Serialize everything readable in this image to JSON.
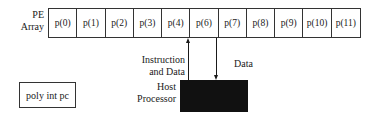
{
  "pe_array": {
    "label_line1": "PE",
    "label_line2": "Array",
    "cells": [
      "p(0)",
      "p(1)",
      "p(2)",
      "p(3)",
      "p(4)",
      "p(6)",
      "p(7)",
      "p(8)",
      "p(9)",
      "p(10)",
      "p(11)"
    ]
  },
  "arrows": {
    "up_label_line1": "Instruction",
    "up_label_line2": "and Data",
    "down_label": "Data"
  },
  "host": {
    "label_line1": "Host",
    "label_line2": "Processor",
    "fill_color": "#111111"
  },
  "poly_box": {
    "label": "poly int pc"
  }
}
